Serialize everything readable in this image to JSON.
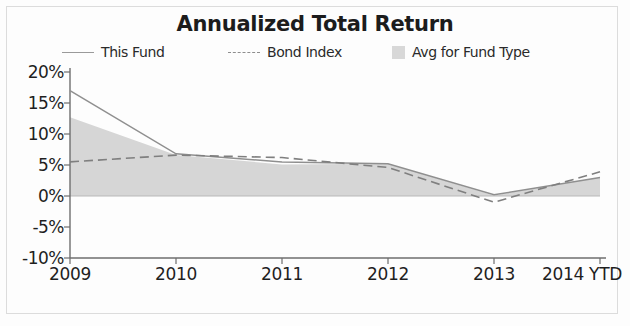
{
  "chart_data": {
    "type": "area",
    "title": "Annualized Total Return",
    "xlabel": "",
    "ylabel": "",
    "categories": [
      "2009",
      "2010",
      "2011",
      "2012",
      "2013",
      "2014 YTD"
    ],
    "x_tick_labels": [
      "2009",
      "2010",
      "2011",
      "2012",
      "2013",
      "2014 YTD"
    ],
    "y_tick_labels": [
      "20%",
      "15%",
      "10%",
      "5%",
      "0%",
      "-5%",
      "-10%"
    ],
    "y_tick_values": [
      20,
      15,
      10,
      5,
      0,
      -5,
      -10
    ],
    "ylim": [
      -10,
      20
    ],
    "grid": false,
    "legend_position": "top",
    "series": [
      {
        "name": "This Fund",
        "style": "solid-line",
        "color": "#8f8f8f",
        "values": [
          17.0,
          6.8,
          5.5,
          5.2,
          0.2,
          3.0
        ]
      },
      {
        "name": "Bond Index",
        "style": "dashed-line",
        "color": "#7f7f7f",
        "values": [
          5.5,
          6.6,
          6.2,
          4.6,
          -1.0,
          3.9
        ]
      },
      {
        "name": "Avg for Fund Type",
        "style": "filled-area",
        "color": "#d6d6d6",
        "values": [
          12.7,
          6.6,
          5.1,
          5.2,
          0.1,
          3.0
        ]
      }
    ]
  },
  "legend": {
    "items": [
      {
        "label": "This Fund",
        "marker": "solid-line-swatch"
      },
      {
        "label": "Bond Index",
        "marker": "dashed-line-swatch"
      },
      {
        "label": "Avg for Fund Type",
        "marker": "filled-box-swatch"
      }
    ]
  },
  "colors": {
    "area_fill": "#d6d6d6",
    "this_fund_line": "#8f8f8f",
    "bond_index_line": "#7f7f7f",
    "axis": "#6e6e6e",
    "text": "#1f1f1f",
    "background": "#fdfdfd"
  }
}
